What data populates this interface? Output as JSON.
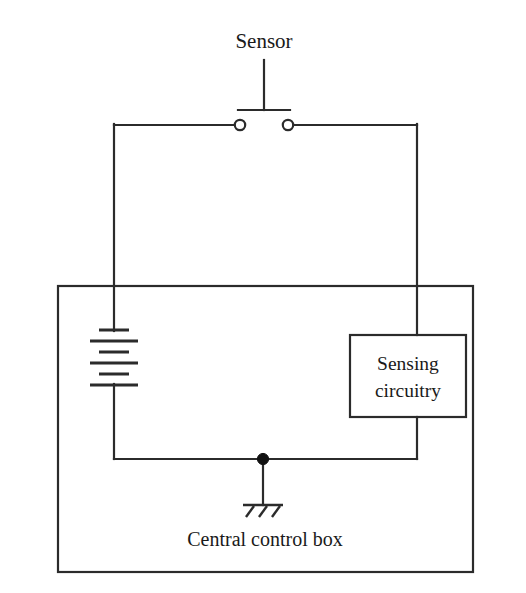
{
  "diagram": {
    "type": "electrical-schematic",
    "colors": {
      "background": "#ffffff",
      "line": "#2b2b2b",
      "text": "#1a1a1a",
      "junction": "#111111"
    },
    "labels": {
      "sensor": "Sensor",
      "sensing_circuitry_line1": "Sensing",
      "sensing_circuitry_line2": "circuitry",
      "central_control_box": "Central control box"
    },
    "components": [
      {
        "name": "sensor-switch",
        "kind": "normally-open pushbutton switch",
        "label": "Sensor",
        "terminals": 2
      },
      {
        "name": "battery",
        "kind": "multi-cell battery",
        "cells": 3,
        "plates": 6
      },
      {
        "name": "sensing-circuitry-block",
        "kind": "functional block",
        "label": "Sensing circuitry"
      },
      {
        "name": "ground",
        "kind": "chassis ground",
        "hatch_strokes": 3
      },
      {
        "name": "junction",
        "kind": "wire junction dot"
      },
      {
        "name": "enclosure",
        "kind": "dashed-free rectangular enclosure",
        "label": "Central control box"
      }
    ],
    "geometry": {
      "enclosure": {
        "x": 58,
        "y": 286,
        "width": 415,
        "height": 286
      },
      "sensing_block": {
        "x": 350,
        "y": 335,
        "width": 116,
        "height": 82
      },
      "left_rail_x": 114,
      "right_rail_x": 417,
      "top_rail_y": 124,
      "bottom_rail_y": 459,
      "switch": {
        "bar_y": 110,
        "bar_x1": 238,
        "bar_x2": 290,
        "stem_x": 264,
        "stem_top_y": 60,
        "terminal_y": 125,
        "terminal_left_x": 240,
        "terminal_right_x": 288,
        "terminal_r": 5.2
      },
      "battery": {
        "center_x": 114,
        "plate_ys": [
          330,
          341,
          352,
          363,
          374,
          385
        ],
        "short_half_width": 15,
        "long_half_width": 24
      },
      "ground": {
        "stem_x": 263,
        "stem_top_y": 459,
        "stem_bottom_y": 505,
        "bar_y": 505,
        "bar_half_width": 20
      },
      "labels": {
        "sensor": {
          "x": 264,
          "y": 48
        },
        "sensing_line1": {
          "x": 408,
          "y": 369
        },
        "sensing_line2": {
          "x": 408,
          "y": 396
        },
        "central_control_box": {
          "x": 265,
          "y": 546
        }
      }
    }
  }
}
